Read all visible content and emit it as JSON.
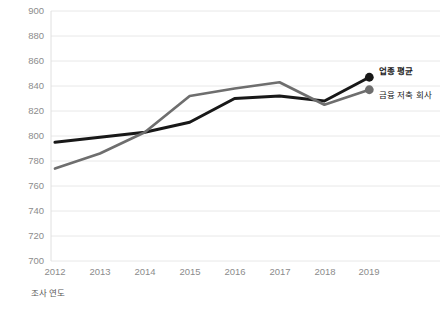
{
  "chart_data": {
    "type": "line",
    "title": "",
    "xlabel": "조사 연도",
    "ylabel": "만족도 점수",
    "categories": [
      "2012",
      "2013",
      "2014",
      "2015",
      "2016",
      "2017",
      "2018",
      "2019"
    ],
    "ylim": [
      700,
      900
    ],
    "ytick_step": 20,
    "yticks": [
      900,
      880,
      860,
      840,
      820,
      800,
      780,
      760,
      740,
      720,
      700
    ],
    "grid": true,
    "grid_axis": "y",
    "legend_position": "right-end-labels",
    "series": [
      {
        "name": "업종 평균",
        "color": "#181818",
        "values": [
          795,
          799,
          803,
          811,
          830,
          832,
          828,
          847
        ],
        "marker_end": true
      },
      {
        "name": "금융 저축 회사",
        "color": "#6e6e6e",
        "values": [
          774,
          786,
          803,
          832,
          838,
          843,
          825,
          837
        ],
        "marker_end": true
      }
    ]
  },
  "axis": {
    "y_title": "만족도 점수",
    "x_title": "조사 연도",
    "y_labels": [
      "900",
      "880",
      "860",
      "840",
      "820",
      "800",
      "780",
      "760",
      "740",
      "720",
      "700"
    ],
    "x_labels": [
      "2012",
      "2013",
      "2014",
      "2015",
      "2016",
      "2017",
      "2018",
      "2019"
    ]
  },
  "legend": {
    "items": [
      {
        "label": "업종 평균",
        "color": "#181818"
      },
      {
        "label": "금융 저축 회사",
        "color": "#6e6e6e"
      }
    ]
  },
  "colors": {
    "series_primary": "#181818",
    "series_secondary": "#6e6e6e",
    "gridline": "#e8e8e8",
    "tick_text": "#8c8c8c",
    "axis_title": "#595959",
    "background": "#ffffff"
  }
}
